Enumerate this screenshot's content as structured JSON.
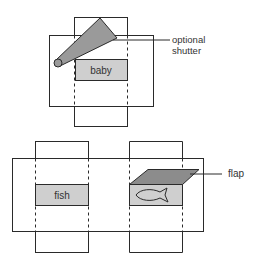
{
  "diagram": {
    "top_figure": {
      "box_label": "baby",
      "callout_line1": "optional",
      "callout_line2": "shutter"
    },
    "bottom_left_figure": {
      "box_label": "fish"
    },
    "bottom_right_figure": {
      "callout": "flap",
      "icon": "fish-outline-icon"
    },
    "colors": {
      "stroke": "#2a2a2a",
      "box_fill": "#cfcfcf",
      "shutter_fill": "#9a9a9a",
      "flap_fill": "#8c8c8c",
      "background": "#ffffff"
    }
  }
}
